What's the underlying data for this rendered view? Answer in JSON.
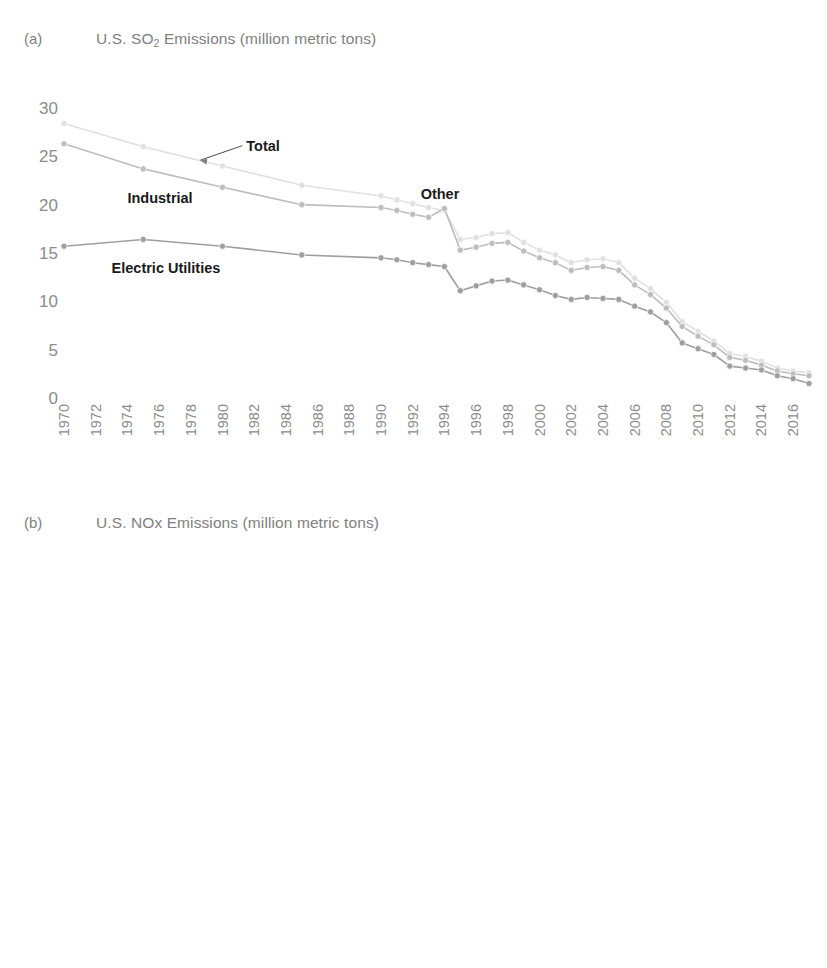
{
  "figure": {
    "background": "#ffffff",
    "panels": [
      {
        "tag": "(a)",
        "title_main": "U.S. SO",
        "title_sub": "2",
        "title_rest": " Emissions (million metric tons)"
      },
      {
        "tag": "(b)",
        "title_main": "U.S. NOx Emissions (million metric tons)",
        "title_sub": "",
        "title_rest": ""
      }
    ]
  },
  "chart_data": [
    {
      "panel": "a",
      "type": "line",
      "title": "U.S. SO2 Emissions (million metric tons)",
      "xlabel": "",
      "ylabel": "",
      "ylim": [
        0,
        30
      ],
      "yticks": [
        0,
        5,
        10,
        15,
        20,
        25,
        30
      ],
      "ytick_labels": [
        "0",
        "5",
        "10",
        "15",
        "20",
        "25",
        "30"
      ],
      "xlim": [
        1970,
        2017
      ],
      "xticks": [
        1970,
        1972,
        1974,
        1976,
        1978,
        1980,
        1982,
        1984,
        1986,
        1988,
        1990,
        1992,
        1994,
        1996,
        1998,
        2000,
        2002,
        2004,
        2006,
        2008,
        2010,
        2012,
        2014,
        2016
      ],
      "xtick_labels": [
        "1970",
        "1972",
        "1974",
        "1976",
        "1978",
        "1980",
        "1982",
        "1984",
        "1986",
        "1988",
        "1990",
        "1992",
        "1994",
        "1996",
        "1998",
        "2000",
        "2002",
        "2004",
        "2006",
        "2008",
        "2010",
        "2012",
        "2014",
        "2016"
      ],
      "grid": false,
      "legend_position": "inline-annotations",
      "annotations": [
        {
          "label": "Total",
          "x": 1981.5,
          "y": 26.0,
          "leader_to_x": 1978.6,
          "leader_to_y": 24.6
        },
        {
          "label": "Industrial",
          "x": 1974.0,
          "y": 20.6
        },
        {
          "label": "Other",
          "x": 1992.5,
          "y": 21.0
        },
        {
          "label": "Electric Utilities",
          "x": 1973.0,
          "y": 13.3
        }
      ],
      "series": [
        {
          "name": "Total",
          "color": "#e0e0e0",
          "marker": "circle",
          "x": [
            1970,
            1975,
            1980,
            1985,
            1990,
            1991,
            1992,
            1993,
            1994,
            1995,
            1996,
            1997,
            1998,
            1999,
            2000,
            2001,
            2002,
            2003,
            2004,
            2005,
            2006,
            2007,
            2008,
            2009,
            2010,
            2011,
            2012,
            2013,
            2014,
            2015,
            2016,
            2017
          ],
          "values": [
            28.4,
            26.0,
            24.0,
            22.0,
            20.9,
            20.5,
            20.1,
            19.7,
            19.4,
            16.4,
            16.6,
            17.0,
            17.1,
            16.1,
            15.3,
            14.8,
            14.0,
            14.3,
            14.4,
            14.0,
            12.4,
            11.3,
            9.9,
            7.9,
            6.9,
            5.9,
            4.6,
            4.3,
            3.8,
            3.1,
            2.8,
            2.6
          ]
        },
        {
          "name": "Other",
          "color": "#bdbdbd",
          "marker": "circle",
          "x": [
            1970,
            1975,
            1980,
            1985,
            1990,
            1991,
            1992,
            1993,
            1994,
            1995,
            1996,
            1997,
            1998,
            1999,
            2000,
            2001,
            2002,
            2003,
            2004,
            2005,
            2006,
            2007,
            2008,
            2009,
            2010,
            2011,
            2012,
            2013,
            2014,
            2015,
            2016,
            2017
          ],
          "values": [
            26.3,
            23.7,
            21.8,
            20.0,
            19.7,
            19.4,
            19.0,
            18.7,
            19.6,
            15.3,
            15.6,
            16.0,
            16.1,
            15.2,
            14.5,
            14.0,
            13.2,
            13.5,
            13.6,
            13.2,
            11.7,
            10.7,
            9.3,
            7.4,
            6.4,
            5.5,
            4.2,
            3.9,
            3.4,
            2.8,
            2.5,
            2.3
          ]
        },
        {
          "name": "Electric Utilities",
          "color": "#9e9e9e",
          "marker": "circle",
          "x": [
            1970,
            1975,
            1980,
            1985,
            1990,
            1991,
            1992,
            1993,
            1994,
            1995,
            1996,
            1997,
            1998,
            1999,
            2000,
            2001,
            2002,
            2003,
            2004,
            2005,
            2006,
            2007,
            2008,
            2009,
            2010,
            2011,
            2012,
            2013,
            2014,
            2015,
            2016,
            2017
          ],
          "values": [
            15.7,
            16.4,
            15.7,
            14.8,
            14.5,
            14.3,
            14.0,
            13.8,
            13.6,
            11.1,
            11.6,
            12.1,
            12.2,
            11.7,
            11.2,
            10.6,
            10.2,
            10.4,
            10.3,
            10.2,
            9.5,
            8.9,
            7.8,
            5.7,
            5.1,
            4.5,
            3.3,
            3.1,
            2.9,
            2.3,
            2.0,
            1.5
          ]
        }
      ]
    },
    {
      "panel": "b",
      "type": "line",
      "title": "U.S. NOx Emissions (million metric tons)",
      "xlabel": "",
      "ylabel": "",
      "ylim": [
        0,
        30
      ],
      "yticks": [
        0,
        5,
        10,
        15,
        20,
        25,
        30
      ],
      "ytick_labels": [
        "0",
        "5",
        "10",
        "15",
        "20",
        "25",
        "30"
      ],
      "xlim": [
        1970,
        2017
      ],
      "xticks": [
        1970,
        1972,
        1974,
        1976,
        1978,
        1980,
        1982,
        1984,
        1986,
        1988,
        1990,
        1992,
        1994,
        1996,
        1998,
        2000,
        2002,
        2004,
        2006,
        2008,
        2010,
        2012,
        2014,
        2016
      ],
      "xtick_labels": [
        "1970",
        "1972",
        "1974",
        "1976",
        "1978",
        "1980",
        "1982",
        "1984",
        "1986",
        "1988",
        "1990",
        "1992",
        "1994",
        "1996",
        "1998",
        "2000",
        "2002",
        "2004",
        "2006",
        "2008",
        "2010",
        "2012",
        "2014",
        "2016"
      ],
      "grid": false,
      "legend_position": "inline-annotations",
      "annotations": [
        {
          "label": "Total",
          "x": 1998.5,
          "y": 24.6,
          "leader_to_x": 1995.6,
          "leader_to_y": 23.6
        },
        {
          "label": "Other",
          "x": 1992.2,
          "y": 22.6
        },
        {
          "label": "Industrial",
          "x": 1976.0,
          "y": 21.4
        },
        {
          "label": "Electric Utilities",
          "x": 1976.5,
          "y": 18.3
        },
        {
          "label": "Vehicles",
          "x": 1976.5,
          "y": 11.3
        }
      ],
      "series": [
        {
          "name": "Total",
          "color": "#e3e3e3",
          "marker": "circle",
          "x": [
            1970,
            1975,
            1980,
            1985,
            1990,
            1991,
            1992,
            1993,
            1994,
            1995,
            1996,
            1997,
            1998,
            1999,
            2000,
            2001,
            2002,
            2003,
            2004,
            2005,
            2006,
            2007,
            2008,
            2009,
            2010,
            2011,
            2012,
            2013,
            2014,
            2015,
            2016,
            2017
          ],
          "values": [
            24.6,
            23.8,
            24.1,
            23.4,
            23.2,
            23.1,
            23.2,
            23.3,
            23.6,
            23.2,
            22.6,
            22.7,
            22.4,
            21.8,
            21.3,
            20.4,
            21.1,
            20.5,
            19.6,
            18.8,
            17.7,
            16.7,
            15.5,
            14.2,
            13.5,
            12.7,
            11.8,
            11.2,
            10.6,
            10.2,
            9.8,
            9.5
          ]
        },
        {
          "name": "Other",
          "color": "#c8c8c8",
          "marker": "circle",
          "x": [
            1970,
            1975,
            1980,
            1985,
            1990,
            1991,
            1992,
            1993,
            1994,
            1995,
            1996,
            1997,
            1998,
            1999,
            2000,
            2001,
            2002,
            2003,
            2004,
            2005,
            2006,
            2007,
            2008,
            2009,
            2010,
            2011,
            2012,
            2013,
            2014,
            2015,
            2016,
            2017
          ],
          "values": [
            22.9,
            22.8,
            23.5,
            22.6,
            22.6,
            22.5,
            22.6,
            22.7,
            23.0,
            22.3,
            21.8,
            21.9,
            21.6,
            20.9,
            20.4,
            19.4,
            20.2,
            19.5,
            18.6,
            17.8,
            16.7,
            15.6,
            14.4,
            13.0,
            12.3,
            11.5,
            10.6,
            10.0,
            9.3,
            8.8,
            8.3,
            8.0
          ]
        },
        {
          "name": "Electric Utilities",
          "color": "#acacac",
          "marker": "circle",
          "x": [
            1970,
            1975,
            1980,
            1985,
            1990,
            1991,
            1992,
            1993,
            1994,
            1995,
            1996,
            1997,
            1998,
            1999,
            2000,
            2001,
            2002,
            2003,
            2004,
            2005,
            2006,
            2007,
            2008,
            2009,
            2010,
            2011,
            2012,
            2013,
            2014,
            2015,
            2016,
            2017
          ],
          "values": [
            18.4,
            19.0,
            20.1,
            18.9,
            18.5,
            18.4,
            18.4,
            18.4,
            18.3,
            18.1,
            17.8,
            17.7,
            17.4,
            17.0,
            16.6,
            15.6,
            18.4,
            17.5,
            16.5,
            15.7,
            14.6,
            13.7,
            12.6,
            11.5,
            10.8,
            10.0,
            9.2,
            8.6,
            8.0,
            7.5,
            7.0,
            6.8
          ]
        },
        {
          "name": "Vehicles",
          "color": "#8f8f8f",
          "marker": "circle",
          "x": [
            1970,
            1975,
            1980,
            1985,
            1990,
            1991,
            1992,
            1993,
            1994,
            1995,
            1996,
            1997,
            1998,
            1999,
            2000,
            2001,
            2002,
            2003,
            2004,
            2005,
            2006,
            2007,
            2008,
            2009,
            2010,
            2011,
            2012,
            2013,
            2014,
            2015,
            2016,
            2017
          ],
          "values": [
            13.9,
            13.7,
            13.7,
            13.5,
            12.4,
            12.4,
            12.4,
            12.4,
            12.4,
            12.3,
            12.2,
            12.1,
            12.0,
            11.8,
            11.6,
            11.0,
            14.1,
            13.4,
            12.6,
            11.9,
            11.2,
            10.5,
            9.7,
            9.0,
            8.5,
            8.0,
            7.6,
            7.3,
            6.9,
            6.6,
            6.3,
            6.1
          ]
        }
      ]
    }
  ]
}
